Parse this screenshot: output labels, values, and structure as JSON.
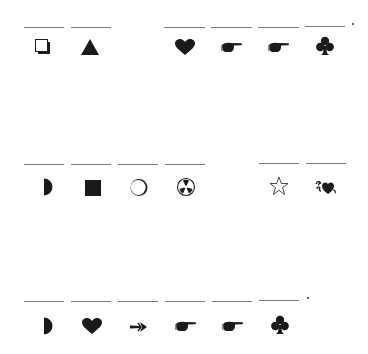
{
  "rows": [
    {
      "line_y": 27,
      "symbol_y": 47,
      "blanks": [
        24,
        71,
        164,
        211,
        258,
        305
      ],
      "trailing_dot": true,
      "symbols": [
        {
          "x": 43,
          "name": "shadowed-square-icon"
        },
        {
          "x": 90,
          "name": "black-triangle-icon"
        },
        {
          "x": 185,
          "name": "black-heart-icon"
        },
        {
          "x": 232,
          "name": "pointing-hand-icon"
        },
        {
          "x": 279,
          "name": "pointing-hand-icon"
        },
        {
          "x": 325,
          "name": "black-club-icon"
        }
      ]
    },
    {
      "line_y": 164,
      "symbol_y": 187,
      "blanks": [
        24,
        71,
        118,
        165,
        259,
        306
      ],
      "trailing_dot": false,
      "symbols": [
        {
          "x": 45,
          "name": "right-half-circle-icon"
        },
        {
          "x": 93,
          "name": "black-square-icon"
        },
        {
          "x": 139,
          "name": "crescent-circle-icon"
        },
        {
          "x": 186,
          "name": "trefoil-circle-icon"
        },
        {
          "x": 279,
          "name": "white-star-icon"
        },
        {
          "x": 326,
          "name": "floral-heart-icon"
        }
      ]
    },
    {
      "line_y": 301,
      "symbol_y": 326,
      "blanks": [
        24,
        71,
        118,
        165,
        212,
        259
      ],
      "trailing_dot": true,
      "symbols": [
        {
          "x": 45,
          "name": "right-half-circle-icon"
        },
        {
          "x": 92,
          "name": "black-heart-icon"
        },
        {
          "x": 139,
          "name": "arrow-right-icon"
        },
        {
          "x": 186,
          "name": "pointing-hand-icon"
        },
        {
          "x": 233,
          "name": "pointing-hand-icon"
        },
        {
          "x": 280,
          "name": "black-club-icon"
        }
      ]
    }
  ],
  "colors": {
    "line": "#7a7a7a",
    "ink": "#1a1a1a"
  }
}
